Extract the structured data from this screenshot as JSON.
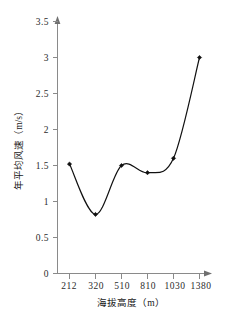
{
  "chart_data": {
    "type": "line",
    "title": "",
    "subtitle": "",
    "xlabel": "海拔高度（m）",
    "ylabel": "年平均风速（m/s）",
    "categories": [
      "212",
      "320",
      "510",
      "810",
      "1030",
      "1380"
    ],
    "values": [
      1.52,
      0.82,
      1.5,
      1.4,
      1.6,
      3.0
    ],
    "series": [
      {
        "name": "年平均风速",
        "values": [
          1.52,
          0.82,
          1.5,
          1.4,
          1.6,
          3.0
        ]
      }
    ],
    "ylim": [
      0,
      3.5
    ],
    "ytick_labels": [
      "0",
      "0.5",
      "1",
      "1.5",
      "2",
      "2.5",
      "3",
      "3.5"
    ],
    "ytick_values": [
      0,
      0.5,
      1,
      1.5,
      2,
      2.5,
      3,
      3.5
    ],
    "xtick_labels": [
      "212",
      "320",
      "510",
      "810",
      "1030",
      "1380"
    ],
    "grid": false,
    "legend": false,
    "legend_position": "none",
    "marker": "filled-diamond",
    "line_style": "smooth-spline",
    "line_color": "#111111",
    "marker_color": "#111111",
    "axis_color": "#8a8a8a",
    "background_color": "#ffffff",
    "annotations": []
  },
  "axis": {
    "y_arrow_icon": "arrow-up-icon",
    "x_arrow_icon": "arrow-right-icon"
  }
}
